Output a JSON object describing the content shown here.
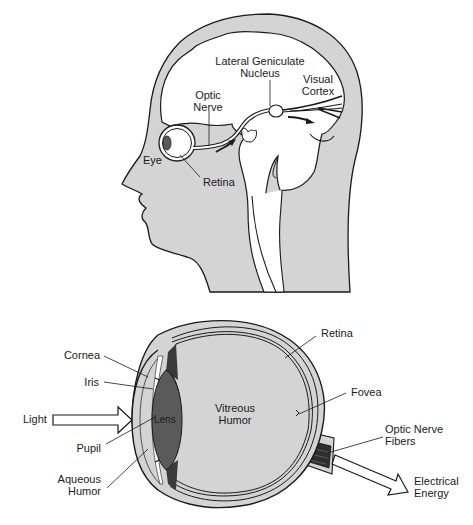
{
  "figure": {
    "head_diagram": {
      "labels": {
        "lgn_line1": "Lateral Geniculate",
        "lgn_line2": "Nucleus",
        "visual_cortex_line1": "Visual",
        "visual_cortex_line2": "Cortex",
        "optic_nerve_line1": "Optic",
        "optic_nerve_line2": "Nerve",
        "eye": "Eye",
        "retina": "Retina"
      }
    },
    "eye_diagram": {
      "labels": {
        "retina": "Retina",
        "cornea": "Cornea",
        "iris": "Iris",
        "light": "Light",
        "lens": "Lens",
        "vitreous_line1": "Vitreous",
        "vitreous_line2": "Humor",
        "fovea": "Fovea",
        "optic_nerve_fibers_line1": "Optic Nerve",
        "optic_nerve_fibers_line2": "Fibers",
        "pupil": "Pupil",
        "aqueous_line1": "Aqueous",
        "aqueous_line2": "Humor",
        "electrical_line1": "Electrical",
        "electrical_line2": "Energy"
      }
    },
    "colors": {
      "tissue_gray": "#d4d4d4",
      "outline": "#1a1a1a",
      "lens_dark": "#5a5a5a",
      "background": "#ffffff"
    }
  }
}
